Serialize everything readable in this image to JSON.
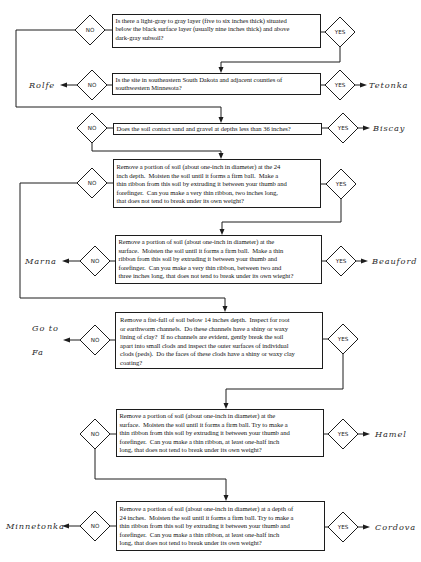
{
  "diagram": {
    "type": "soil identification key flowchart",
    "no_label": "NO",
    "yes_label": "YES",
    "questions": [
      {
        "text": "Is there a light-gray to gray layer (five to six inches thick) situated\nbelow the black surface layer (usually nine inches thick) and above\ndark-gray subsoil?",
        "no": "go to question 3",
        "yes": "go to question 2"
      },
      {
        "text": "Is the site in southeastern South Dakota and adjacent counties of\nsouthwestern Minnesota?",
        "no": "Rolfe",
        "yes": "Tetonka"
      },
      {
        "text": "Does the soil contact sand and gravel at depths less than 36 inches?",
        "no": "go to question 4",
        "yes": "Biscay"
      },
      {
        "text": "Remove a portion of soil (about one-inch in diameter) at the 24\ninch depth.  Moisten the soil until it forms a firm ball.  Make a\nthin ribbon from this soil by extruding it between your thumb and\nforefinger.  Can you make a very thin ribbon, two inches long,\nthat does not tend to break under its own weight?",
        "no": "go to question 6",
        "yes": "go to question 5"
      },
      {
        "text": "Remove a portion of soil (about one-inch in diameter) at the\nsurface.  Moisten the soil until it forms a firm ball.  Make a thin\nribbon from this soil by extruding it between your thumb and\nforefinger.  Can you make a very thin ribbon, between two and\nthree inches long, that does not tend to break under its own wieght?",
        "no": "Marna",
        "yes": "Beauford"
      },
      {
        "text": " Remove a fist-full of soil below 14 inches depth.  Inspect for root\n or earthworm channels.  Do these channels have a shiny or waxy\n lining of clay?  If no channels are evident, gently break the soil\n apart into small clods and inspect the outer surfaces of individual\n clods (peds).  Do the faces of these clods have a shiny or waxy clay\n coating?",
        "no": "Go to Fa",
        "yes": "go to question 7"
      },
      {
        "text": "Remove a portion of soil (about one-inch in diameter) at the\nsurface.  Moisten the soil until it forms a firm ball. Try to make a\nthin ribbon from this soil by extruding it between your thumb and\nforefinger.  Can you make a thin ribbon, at least one-half inch\nlong, that does not tend to break under its own weight?",
        "no": "go to question 8",
        "yes": "Hamel"
      },
      {
        "text": "Remove a portion of soil (about one-inch in diameter) at a depth of\n24 inches.  Moisten the soil until it forms a firm ball. Try to make a\nthin ribbon from this soil by extruding it between your thumb and\nforefinger.  Can you make a thin ribbon, at least one-half inch\nlong, that does not tend to break under its own weight?",
        "no": "Minnetonka",
        "yes": "Cordova"
      }
    ],
    "outcomes": {
      "rolfe": "Rolfe",
      "tetonka": "Tetonka",
      "biscay": "Biscay",
      "marna": "Marna",
      "beauford": "Beauford",
      "goto_line1": "Go to",
      "goto_line2": "Fa",
      "hamel": "Hamel",
      "minnetonka": "Minnetonka",
      "cordova": "Cordova"
    }
  }
}
